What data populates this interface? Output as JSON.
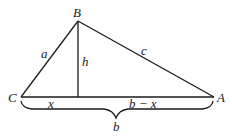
{
  "diagram": {
    "vertices": [
      {
        "name": "C",
        "label": "C",
        "x": 21,
        "y": 97
      },
      {
        "name": "B",
        "label": "B",
        "x": 78,
        "y": 21
      },
      {
        "name": "A",
        "label": "A",
        "x": 214,
        "y": 97
      }
    ],
    "altitude_foot": {
      "x": 78,
      "y": 97
    },
    "side_labels": {
      "a": "a",
      "c": "c",
      "h": "h",
      "x": "x",
      "b_minus_x": "b − x",
      "b": "b"
    },
    "colors": {
      "stroke": "#1a1a1a",
      "background": "#ffffff"
    }
  }
}
